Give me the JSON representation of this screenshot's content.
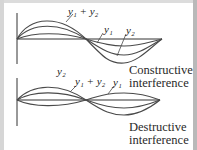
{
  "diagram": {
    "top": {
      "title": "Constructive interference",
      "caption_line1": "Constructive",
      "caption_line2": "interference",
      "labels": {
        "sum": "y₁ + y₂",
        "y1": "y₁",
        "y2": "y₂"
      },
      "waves": [
        {
          "name": "y1 + y2",
          "amplitude": 18,
          "phase": "in-phase"
        },
        {
          "name": "y1",
          "amplitude": 13,
          "phase": "in-phase"
        },
        {
          "name": "y2",
          "amplitude": 5,
          "phase": "in-phase"
        }
      ]
    },
    "bottom": {
      "title": "Destructive interference",
      "caption_line1": "Destructive",
      "caption_line2": "interference",
      "labels": {
        "sum": "y₁ + y₂",
        "y1": "y₁",
        "y2": "y₂"
      },
      "waves": [
        {
          "name": "y2",
          "amplitude": 15,
          "phase": "0"
        },
        {
          "name": "y1 + y2",
          "amplitude": 8,
          "phase": "0"
        },
        {
          "name": "y1",
          "amplitude": 7,
          "phase": "180deg"
        }
      ]
    },
    "colors": {
      "wave": "#4a4a4a",
      "axis": "#333333",
      "frame": "#d6d6d6"
    }
  }
}
